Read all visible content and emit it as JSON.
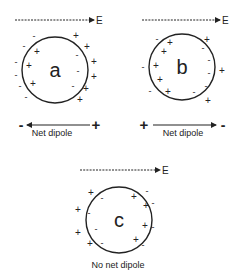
{
  "colors": {
    "stroke": "#222222",
    "background": "#ffffff"
  },
  "field_label": "E",
  "panels": [
    {
      "id": "a",
      "letter": "a",
      "field": {
        "x1": 15,
        "x2": 94,
        "y": 20,
        "label_x": 96
      },
      "circle": {
        "cx": 55,
        "cy": 70,
        "r": 33
      },
      "charges": [
        {
          "s": "-",
          "x": 34,
          "y": 36
        },
        {
          "s": "+",
          "x": 76,
          "y": 36
        },
        {
          "s": "-",
          "x": 24,
          "y": 46
        },
        {
          "s": "+",
          "x": 37,
          "y": 52
        },
        {
          "s": "+",
          "x": 87,
          "y": 47
        },
        {
          "s": "-",
          "x": 77,
          "y": 55
        },
        {
          "s": "-",
          "x": 16,
          "y": 62
        },
        {
          "s": "+",
          "x": 29,
          "y": 66
        },
        {
          "s": "+",
          "x": 94,
          "y": 62
        },
        {
          "s": "-",
          "x": 78,
          "y": 71
        },
        {
          "s": "-",
          "x": 16,
          "y": 75
        },
        {
          "s": "+",
          "x": 94,
          "y": 77
        },
        {
          "s": "-",
          "x": 20,
          "y": 86
        },
        {
          "s": "+",
          "x": 33,
          "y": 84
        },
        {
          "s": "-",
          "x": 73,
          "y": 86
        },
        {
          "s": "+",
          "x": 86,
          "y": 89
        },
        {
          "s": "-",
          "x": 26,
          "y": 97
        },
        {
          "s": "+",
          "x": 80,
          "y": 100
        }
      ],
      "dipole": {
        "arrow_from": 90,
        "arrow_to": 27,
        "y": 125,
        "left_sign": "-",
        "left_x": 21,
        "right_sign": "+",
        "right_x": 96,
        "label": "Net dipole",
        "label_x": 52,
        "label_y": 136
      }
    },
    {
      "id": "b",
      "letter": "b",
      "field": {
        "x1": 142,
        "x2": 220,
        "y": 20,
        "label_x": 222
      },
      "circle": {
        "cx": 182,
        "cy": 67,
        "r": 33
      },
      "charges": [
        {
          "s": "-",
          "x": 157,
          "y": 39
        },
        {
          "s": "+",
          "x": 170,
          "y": 43
        },
        {
          "s": "+",
          "x": 207,
          "y": 40
        },
        {
          "s": "-",
          "x": 203,
          "y": 48
        },
        {
          "s": "+",
          "x": 164,
          "y": 52
        },
        {
          "s": "-",
          "x": 209,
          "y": 60
        },
        {
          "s": "-",
          "x": 143,
          "y": 67
        },
        {
          "s": "+",
          "x": 156,
          "y": 66
        },
        {
          "s": "+",
          "x": 222,
          "y": 71
        },
        {
          "s": "-",
          "x": 209,
          "y": 73
        },
        {
          "s": "+",
          "x": 160,
          "y": 80
        },
        {
          "s": "-",
          "x": 206,
          "y": 86
        },
        {
          "s": "-",
          "x": 150,
          "y": 91
        },
        {
          "s": "+",
          "x": 168,
          "y": 92
        },
        {
          "s": "-",
          "x": 194,
          "y": 92
        },
        {
          "s": "+",
          "x": 208,
          "y": 101
        }
      ],
      "dipole": {
        "arrow_from": 153,
        "arrow_to": 216,
        "y": 125,
        "left_sign": "+",
        "left_x": 144,
        "right_sign": "-",
        "right_x": 223,
        "label": "Net dipole",
        "label_x": 183,
        "label_y": 136
      }
    },
    {
      "id": "c",
      "letter": "c",
      "field": {
        "x1": 80,
        "x2": 160,
        "y": 170,
        "label_x": 162
      },
      "circle": {
        "cx": 119,
        "cy": 220,
        "r": 33
      },
      "charges": [
        {
          "s": "+",
          "x": 91,
          "y": 193
        },
        {
          "s": "-",
          "x": 102,
          "y": 198
        },
        {
          "s": "+",
          "x": 134,
          "y": 197
        },
        {
          "s": "-",
          "x": 147,
          "y": 191
        },
        {
          "s": "-",
          "x": 153,
          "y": 203
        },
        {
          "s": "+",
          "x": 146,
          "y": 206
        },
        {
          "s": "+",
          "x": 78,
          "y": 210
        },
        {
          "s": "-",
          "x": 89,
          "y": 213
        },
        {
          "s": "-",
          "x": 96,
          "y": 229
        },
        {
          "s": "+",
          "x": 145,
          "y": 226
        },
        {
          "s": "-",
          "x": 153,
          "y": 227
        },
        {
          "s": "+",
          "x": 78,
          "y": 233
        },
        {
          "s": "+",
          "x": 90,
          "y": 244
        },
        {
          "s": "-",
          "x": 102,
          "y": 243
        },
        {
          "s": "+",
          "x": 136,
          "y": 240
        },
        {
          "s": "-",
          "x": 143,
          "y": 245
        }
      ],
      "caption": {
        "label": "No net dipole",
        "x": 118,
        "y": 268
      }
    }
  ]
}
